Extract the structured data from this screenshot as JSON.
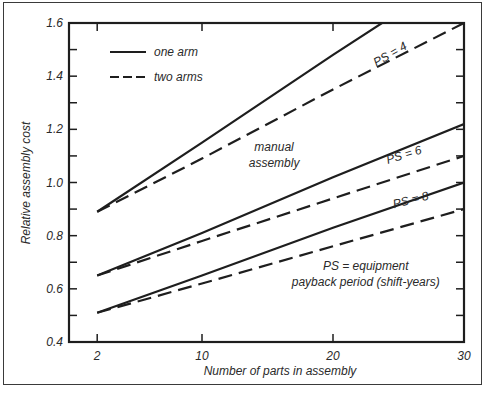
{
  "chart_data": {
    "type": "line",
    "title": "",
    "xlabel": "Number of parts in assembly",
    "ylabel": "Relative assembly cost",
    "xlim": [
      0,
      30
    ],
    "ylim": [
      0.4,
      1.6
    ],
    "x_ticks": [
      2,
      10,
      20,
      30
    ],
    "y_ticks": [
      0.4,
      0.6,
      0.8,
      1.0,
      1.2,
      1.4,
      1.6
    ],
    "y_minor_step": 0.1,
    "grid": false,
    "legend": {
      "position": "upper left",
      "entries": [
        {
          "label": "one arm",
          "style": "solid"
        },
        {
          "label": "two arms",
          "style": "dashed"
        }
      ]
    },
    "x": [
      2,
      10,
      20,
      30
    ],
    "series": [
      {
        "name": "PS = 4, one arm",
        "style": "solid",
        "values": [
          0.89,
          1.15,
          1.48,
          1.8
        ],
        "note": "clipped at 1.6 near x≈24"
      },
      {
        "name": "PS = 4, two arms",
        "style": "dashed",
        "values": [
          0.89,
          1.09,
          1.35,
          1.6
        ]
      },
      {
        "name": "PS = 6, one arm",
        "style": "solid",
        "values": [
          0.65,
          0.81,
          1.02,
          1.22
        ]
      },
      {
        "name": "PS = 6, two arms",
        "style": "dashed",
        "values": [
          0.65,
          0.78,
          0.94,
          1.1
        ]
      },
      {
        "name": "PS = 8, one arm",
        "style": "solid",
        "values": [
          0.51,
          0.65,
          0.83,
          1.0
        ]
      },
      {
        "name": "PS = 8, two arms",
        "style": "dashed",
        "values": [
          0.51,
          0.62,
          0.76,
          0.9
        ]
      }
    ],
    "annotations": [
      {
        "text": "PS = 4",
        "x": 24.5,
        "y": 1.47,
        "rotate": -30
      },
      {
        "text": "PS = 6",
        "x": 25.5,
        "y": 1.09,
        "rotate": -17
      },
      {
        "text": "PS = 8",
        "x": 26,
        "y": 0.92,
        "rotate": -14
      },
      {
        "text": "manual",
        "x": 15.5,
        "y": 1.12,
        "rotate": 0
      },
      {
        "text": "assembly",
        "x": 15.5,
        "y": 1.06,
        "rotate": 0
      },
      {
        "text": "PS = equipment",
        "x": 22.5,
        "y": 0.67,
        "rotate": 0
      },
      {
        "text": "payback period (shift-years)",
        "x": 22.5,
        "y": 0.61,
        "rotate": 0
      }
    ]
  },
  "colors": {
    "line": "#1e1e1e",
    "axis": "#1e1e1e",
    "frame": "#3a3a3a",
    "background": "#ffffff"
  }
}
